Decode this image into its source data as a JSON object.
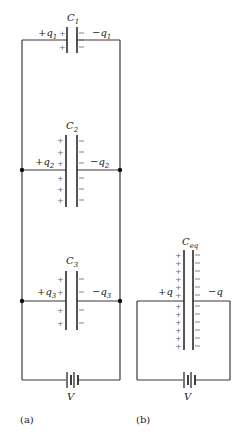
{
  "figure": {
    "panel_a": {
      "caption": "(a)",
      "battery_label": "V",
      "capacitors": [
        {
          "name": "C",
          "sub": "1",
          "plus": "+q",
          "plus_sub": "1",
          "minus": "−q",
          "minus_sub": "1"
        },
        {
          "name": "C",
          "sub": "2",
          "plus": "+q",
          "plus_sub": "2",
          "minus": "−q",
          "minus_sub": "2"
        },
        {
          "name": "C",
          "sub": "3",
          "plus": "+q",
          "plus_sub": "3",
          "minus": "−q",
          "minus_sub": "3"
        }
      ]
    },
    "panel_b": {
      "caption": "(b)",
      "battery_label": "V",
      "capacitor": {
        "name": "C",
        "sub": "eq",
        "plus": "+q",
        "minus": "−q"
      }
    },
    "signs": {
      "plus": "+",
      "minus": "−"
    }
  }
}
